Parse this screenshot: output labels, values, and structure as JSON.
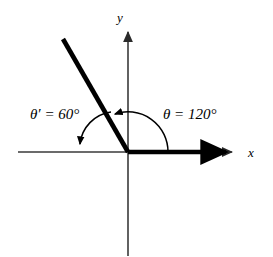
{
  "figure": {
    "background_color": "#ffffff",
    "stroke_color": "#000000",
    "axis_color": "#3a3a3a",
    "type": "angle-diagram",
    "origin": {
      "x": 128,
      "y": 152
    },
    "axes": {
      "x_label": "x",
      "y_label": "y",
      "x_line": {
        "x1": 18,
        "y1": 152,
        "x2": 235,
        "y2": 152
      },
      "y_line": {
        "x1": 128,
        "y1": 30,
        "x2": 128,
        "y2": 256
      }
    },
    "initial_side": {
      "name": "initial-side-ray",
      "from": {
        "x": 128,
        "y": 152
      },
      "to": {
        "x": 232,
        "y": 152
      },
      "arrow": true
    },
    "terminal_side": {
      "name": "terminal-side-ray",
      "from": {
        "x": 128,
        "y": 152
      },
      "to": {
        "x": 63,
        "y": 39
      },
      "angle_degrees": 120
    },
    "angles": [
      {
        "id": "theta",
        "label": "θ = 120°",
        "value": 120,
        "unit": "degrees",
        "label_position": {
          "x": 163,
          "y": 119
        },
        "arc_start": {
          "x": 168,
          "y": 152
        },
        "arc_end": {
          "x": 113,
          "y": 111
        },
        "arrow_direction": "counterclockwise"
      },
      {
        "id": "theta-prime",
        "label": "θ′ = 60°",
        "value": 60,
        "unit": "degrees",
        "label_position": {
          "x": 30,
          "y": 119
        },
        "arc_start": {
          "x": 112,
          "y": 113
        },
        "arc_end": {
          "x": 79,
          "y": 148
        },
        "arrow_direction": "clockwise"
      }
    ]
  }
}
